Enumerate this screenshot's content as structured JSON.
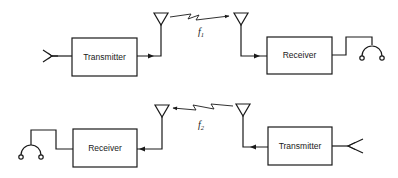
{
  "diagram": {
    "title": "",
    "links": [
      {
        "id": "link-1",
        "frequency_label": "f",
        "frequency_subscript": "1",
        "direction": "left-to-right",
        "transmitter": {
          "label": "Transmitter",
          "input": "microphone"
        },
        "receiver": {
          "label": "Receiver",
          "output": "headphones"
        }
      },
      {
        "id": "link-2",
        "frequency_label": "f",
        "frequency_subscript": "2",
        "direction": "right-to-left",
        "transmitter": {
          "label": "Transmitter",
          "input": "microphone"
        },
        "receiver": {
          "label": "Receiver",
          "output": "headphones"
        }
      }
    ],
    "colors": {
      "stroke": "#1a1a1a",
      "background": "#ffffff"
    }
  }
}
